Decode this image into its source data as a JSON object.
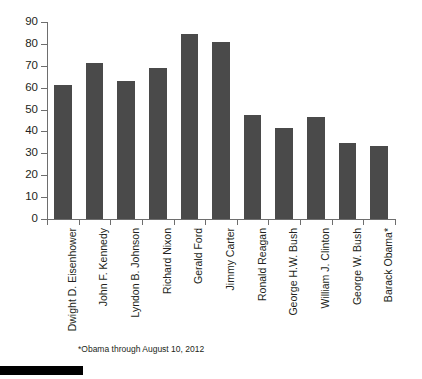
{
  "chart_data": {
    "type": "bar",
    "title": "",
    "subtitle": "",
    "xlabel": "",
    "ylabel": "",
    "ylim": [
      0,
      90
    ],
    "ytick_step": 10,
    "yticks": [
      0,
      10,
      20,
      30,
      40,
      50,
      60,
      70,
      80,
      90
    ],
    "grid": false,
    "legend": false,
    "legend_position": "none",
    "orientation": "vertical",
    "bar_color": "#4a4a4a",
    "axis_color": "#6e6e6e",
    "text_color": "#231f20",
    "background": "#ffffff",
    "categories": [
      "Dwight D. Eisenhower",
      "John F. Kennedy",
      "Lyndon B. Johnson",
      "Richard Nixon",
      "Gerald Ford",
      "Jimmy Carter",
      "Ronald Reagan",
      "George H.W. Bush",
      "William J. Clinton",
      "George W. Bush",
      "Barack Obama*"
    ],
    "values": [
      61,
      71.5,
      63,
      69,
      84.5,
      81,
      47.5,
      41.5,
      46.5,
      34.5,
      33.5
    ],
    "annotations": [
      "*Obama through August 10, 2012"
    ]
  },
  "footnote": "*Obama through August 10, 2012"
}
